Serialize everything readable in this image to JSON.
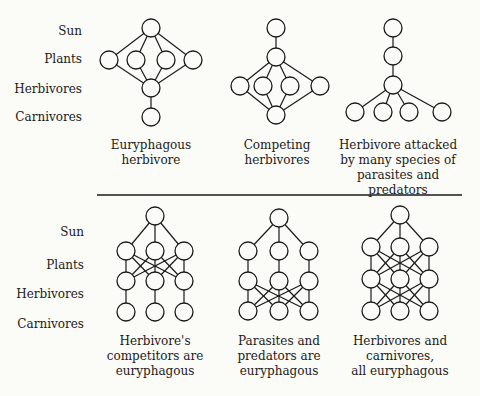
{
  "row_labels": [
    "Sun",
    "Plants",
    "Herbivores",
    "Carnivores"
  ],
  "top_row": {
    "label_y": [
      32,
      60,
      90,
      118
    ],
    "diagrams": [
      {
        "caption": [
          "Euryphagous",
          "herbivore"
        ]
      },
      {
        "caption": [
          "Competing",
          "herbivores"
        ]
      },
      {
        "caption": [
          "Herbivore attacked",
          "by many species of",
          "parasites and",
          "predators"
        ]
      }
    ]
  },
  "bottom_row": {
    "label_y": [
      215,
      249,
      280,
      311
    ],
    "diagrams": [
      {
        "caption": [
          "Herbivore's",
          "competitors are",
          "euryphagous"
        ]
      },
      {
        "caption": [
          "Parasites and",
          "predators are",
          "euryphagous"
        ]
      },
      {
        "caption": [
          "Herbivores and",
          "carnivores,",
          "all euryphagous"
        ]
      }
    ]
  },
  "colors": {
    "ink": "#1a1a1a",
    "paper": "#fbfbf7"
  }
}
